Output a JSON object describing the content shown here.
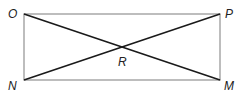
{
  "diagram": {
    "type": "rectangle-with-diagonals",
    "vertices": {
      "O": {
        "label": "O",
        "x": 24,
        "y": 14
      },
      "P": {
        "label": "P",
        "x": 220,
        "y": 14
      },
      "M": {
        "label": "M",
        "x": 220,
        "y": 80
      },
      "N": {
        "label": "N",
        "x": 24,
        "y": 80
      }
    },
    "intersection": {
      "label": "R",
      "x": 122,
      "y": 47
    },
    "colors": {
      "rectangle": "#9a9a9a",
      "diagonals": "#1a1a1a",
      "labels": "#222222"
    }
  }
}
